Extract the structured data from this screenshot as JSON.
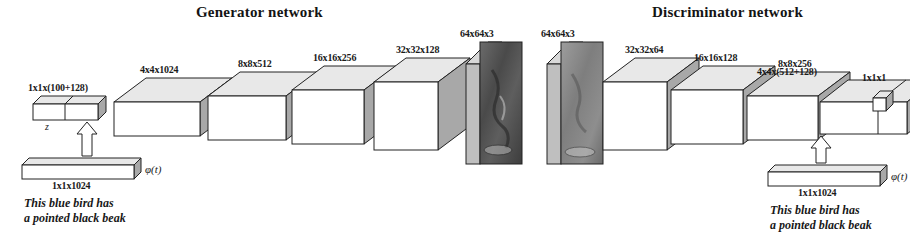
{
  "figure": {
    "background_color": "#ffffff",
    "stroke_color": "#222222",
    "box_front_color": "#ffffff",
    "box_top_color": "#e8e8e8",
    "box_side_color": "#a8a8a8"
  },
  "titles": {
    "generator": "Generator network",
    "discriminator": "Discriminator network"
  },
  "generator": {
    "noise_block_label": "1x1x(100+128)",
    "noise_symbol": "z",
    "text_embed_label": "1x1x1024",
    "text_embed_symbol": "φ(t)",
    "caption_line1": "This blue bird has",
    "caption_line2": "a pointed black beak",
    "layers": [
      {
        "label": "4x4x1024"
      },
      {
        "label": "8x8x512"
      },
      {
        "label": "16x16x256"
      },
      {
        "label": "32x32x128"
      }
    ],
    "output_image_label": "64x64x3"
  },
  "discriminator": {
    "input_image_label": "64x64x3",
    "layers": [
      {
        "label": "32x32x64"
      },
      {
        "label": "16x16x128"
      },
      {
        "label": "8x8x256"
      },
      {
        "label": "4x4x(512+128)"
      }
    ],
    "output_label": "1x1x1",
    "text_embed_label": "1x1x1024",
    "text_embed_symbol": "φ(t)",
    "caption_line1": "This blue bird has",
    "caption_line2": "a pointed black beak"
  }
}
